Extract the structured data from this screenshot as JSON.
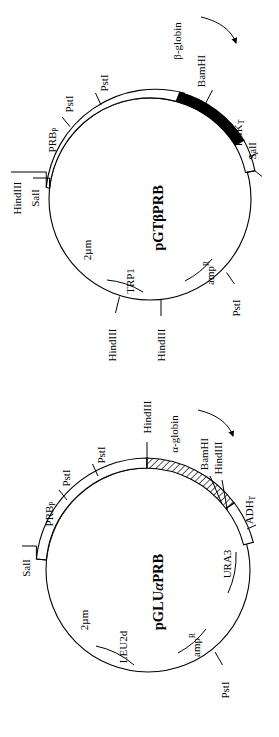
{
  "figure": {
    "type": "plasmid-map-figure",
    "panel_count": 2
  },
  "panels": [
    {
      "id": "pGTbetaPRB",
      "plasmid_name": "pGTβPRB",
      "name_parts": [
        "pGT",
        "β",
        "PRB"
      ],
      "transcript_label": "β-globin",
      "transcript_arrow": "curved-arrow-clockwise",
      "restriction_sites": [
        {
          "name": "HindIII",
          "position": "upper-left-outer"
        },
        {
          "name": "SalI",
          "position": "upper-left-inner"
        },
        {
          "name": "PstI",
          "position": "upper-left-ring-1"
        },
        {
          "name": "PstI",
          "position": "upper-left-ring-2"
        },
        {
          "name": "BamHI",
          "position": "top-right-black-segment"
        },
        {
          "name": "SalI",
          "position": "right-ring-end"
        },
        {
          "name": "PstI",
          "position": "lower-right"
        },
        {
          "name": "HindIII",
          "position": "bottom-left"
        },
        {
          "name": "HindIII",
          "position": "bottom-center"
        }
      ],
      "features": [
        {
          "name": "PRB",
          "subscript": "P",
          "display": "PRBₚ",
          "kind": "promoter"
        },
        {
          "name": "PGK",
          "subscript": "T",
          "display": "PGKₜ",
          "kind": "terminator"
        },
        {
          "name": "2µm",
          "kind": "origin"
        },
        {
          "name": "TRP1",
          "kind": "marker"
        },
        {
          "name": "amp",
          "superscript": "R",
          "display": "ampᴿ",
          "kind": "marker"
        }
      ],
      "segments": [
        {
          "fill": "white",
          "label": "PRB promoter region"
        },
        {
          "fill": "black",
          "label": "β-globin coding"
        },
        {
          "fill": "white",
          "label": "PGK terminator"
        }
      ]
    },
    {
      "id": "pGLUalphaPRB",
      "plasmid_name": "pGLUαPRB",
      "name_parts": [
        "pGLU",
        "α",
        "PRB"
      ],
      "transcript_label": "α-globin",
      "transcript_arrow": "curved-arrow-clockwise",
      "restriction_sites": [
        {
          "name": "SalI",
          "position": "left-ring-end"
        },
        {
          "name": "PstI",
          "position": "upper-left-ring-1"
        },
        {
          "name": "PstI",
          "position": "upper-left-ring-2"
        },
        {
          "name": "HindIII",
          "position": "top-hatch-start"
        },
        {
          "name": "BamHI",
          "position": "top-right-hatch-end-1"
        },
        {
          "name": "HindIII",
          "position": "top-right-hatch-end-2"
        },
        {
          "name": "PstI",
          "position": "bottom-right"
        }
      ],
      "features": [
        {
          "name": "PRB",
          "subscript": "P",
          "display": "PRBₚ",
          "kind": "promoter"
        },
        {
          "name": "ADH",
          "subscript": "T",
          "display": "ADHₜ",
          "kind": "terminator"
        },
        {
          "name": "URA3",
          "kind": "marker"
        },
        {
          "name": "2µm",
          "kind": "origin"
        },
        {
          "name": "LEU2d",
          "kind": "marker"
        },
        {
          "name": "amp",
          "superscript": "R",
          "display": "ampᴿ",
          "kind": "marker"
        }
      ],
      "segments": [
        {
          "fill": "white",
          "label": "PRB promoter region"
        },
        {
          "fill": "hatched",
          "label": "α-globin coding"
        },
        {
          "fill": "white",
          "label": "ADH terminator"
        }
      ]
    }
  ],
  "labels": {
    "p1_hindIII_ul": "HindIII",
    "p1_salI_ul": "SalI",
    "p1_PRB": "PRB",
    "p1_PRB_sub": "P",
    "p1_pstI_a": "PstI",
    "p1_pstI_b": "PstI",
    "p1_bamHI": "BamHI",
    "p1_beta": "β-globin",
    "p1_PGK": "PGK",
    "p1_PGK_sub": "T",
    "p1_salI_r": "SalI",
    "p1_pstI_lr": "PstI",
    "p1_amp": "amp",
    "p1_amp_sup": "R",
    "p1_TRP1": "TRP1",
    "p1_2um": "2µm",
    "p1_hindIII_b1": "HindIII",
    "p1_hindIII_b2": "HindIII",
    "p1_name_a": "pGT",
    "p1_name_b": "β",
    "p1_name_c": "PRB",
    "p2_salI_l": "SalI",
    "p2_PRB": "PRB",
    "p2_PRB_sub": "P",
    "p2_pstI_a": "PstI",
    "p2_pstI_b": "PstI",
    "p2_hindIII_t": "HindIII",
    "p2_alpha": "α-globin",
    "p2_bamHI": "BamHI",
    "p2_hindIII_r": "HindIII",
    "p2_ADH": "ADH",
    "p2_ADH_sub": "T",
    "p2_URA3": "URA3",
    "p2_2um": "2µm",
    "p2_LEU2d": "LEU2d",
    "p2_amp": "amp",
    "p2_amp_sup": "R",
    "p2_pstI_br": "PstI",
    "p2_name_a": "pGLU",
    "p2_name_b": "α",
    "p2_name_c": "PRB"
  },
  "colors": {
    "stroke": "#000000",
    "background": "#ffffff",
    "segment_fill": "#000000"
  }
}
